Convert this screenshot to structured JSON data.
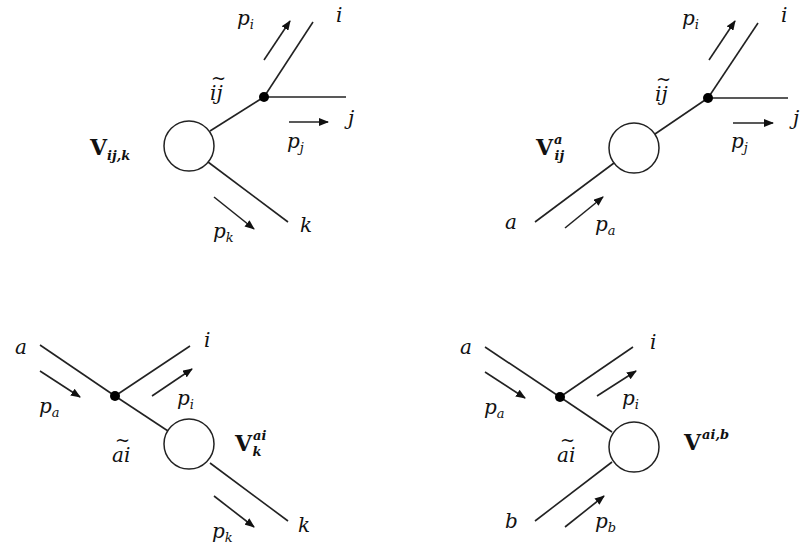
{
  "figure": {
    "diagrams": [
      {
        "id": "final-final",
        "name": "V_{ij,k}",
        "vertex_label": {
          "main": "V",
          "sub": "ij,k",
          "sup": ""
        },
        "emitter_label": {
          "text": "ij",
          "tilde": "~"
        },
        "legs": [
          {
            "particle": "i",
            "momentum": "p",
            "momentum_index": "i"
          },
          {
            "particle": "j",
            "momentum": "p",
            "momentum_index": "j"
          },
          {
            "particle": "k",
            "momentum": "p",
            "momentum_index": "k"
          }
        ]
      },
      {
        "id": "final-initial",
        "name": "V_{ij}^a",
        "vertex_label": {
          "main": "V",
          "sub": "ij",
          "sup": "a"
        },
        "emitter_label": {
          "text": "ij",
          "tilde": "~"
        },
        "legs": [
          {
            "particle": "i",
            "momentum": "p",
            "momentum_index": "i"
          },
          {
            "particle": "j",
            "momentum": "p",
            "momentum_index": "j"
          },
          {
            "particle": "a",
            "momentum": "p",
            "momentum_index": "a"
          }
        ]
      },
      {
        "id": "initial-final",
        "name": "V_k^{ai}",
        "vertex_label": {
          "main": "V",
          "sub": "k",
          "sup": "ai"
        },
        "emitter_label": {
          "text": "ai",
          "tilde": "~"
        },
        "legs": [
          {
            "particle": "a",
            "momentum": "p",
            "momentum_index": "a"
          },
          {
            "particle": "i",
            "momentum": "p",
            "momentum_index": "i"
          },
          {
            "particle": "k",
            "momentum": "p",
            "momentum_index": "k"
          }
        ]
      },
      {
        "id": "initial-initial",
        "name": "V^{ai,b}",
        "vertex_label": {
          "main": "V",
          "sub": "",
          "sup": "ai,b"
        },
        "emitter_label": {
          "text": "ai",
          "tilde": "~"
        },
        "legs": [
          {
            "particle": "a",
            "momentum": "p",
            "momentum_index": "a"
          },
          {
            "particle": "i",
            "momentum": "p",
            "momentum_index": "i"
          },
          {
            "particle": "b",
            "momentum": "p",
            "momentum_index": "b"
          }
        ]
      }
    ]
  }
}
